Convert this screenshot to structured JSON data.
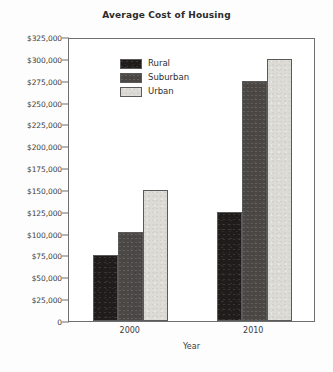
{
  "chart_data": {
    "type": "bar",
    "title": "Average Cost of Housing",
    "xlabel": "Year",
    "ylabel": "",
    "categories": [
      "2000",
      "2010"
    ],
    "series": [
      {
        "name": "Rural",
        "values": [
          76000,
          125000
        ],
        "color": "#1f1c1b"
      },
      {
        "name": "Suburban",
        "values": [
          102000,
          275000
        ],
        "color": "#4a4745"
      },
      {
        "name": "Urban",
        "values": [
          150000,
          300000
        ],
        "color": "#dddbd6"
      }
    ],
    "ylim": [
      0,
      325000
    ],
    "ytick_step": 25000,
    "ytick_labels": [
      "$325,000",
      "$300,000",
      "$275,000",
      "$250,000",
      "$225,000",
      "$200,000",
      "$175,000",
      "$150,000",
      "$125,000",
      "$100,000",
      "$75,000",
      "$50,000",
      "$25,000",
      "0"
    ],
    "ytick_values": [
      325000,
      300000,
      275000,
      250000,
      225000,
      200000,
      175000,
      150000,
      125000,
      100000,
      75000,
      50000,
      25000,
      0
    ],
    "grid": false,
    "legend_position": "upper-left-inside",
    "legend_entries": [
      "Rural",
      "Suburban",
      "Urban"
    ]
  }
}
